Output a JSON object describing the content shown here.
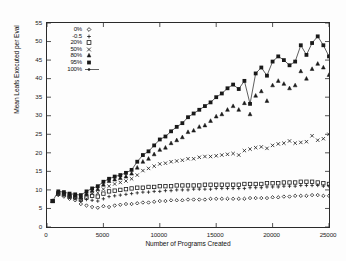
{
  "chart_data": {
    "type": "scatter",
    "title": "",
    "xlabel": "Number of Programs Created",
    "ylabel": "Mean Leafs Executed per Eval",
    "xlim": [
      0,
      25000
    ],
    "ylim": [
      0,
      55
    ],
    "xticks": [
      0,
      5000,
      10000,
      15000,
      20000,
      25000
    ],
    "yticks": [
      0,
      5,
      10,
      15,
      20,
      25,
      30,
      35,
      40,
      45,
      50,
      55
    ],
    "grid": false,
    "legend_position": "upper-left-inside",
    "x": [
      500,
      1000,
      1500,
      2000,
      2500,
      3000,
      3500,
      4000,
      4500,
      5000,
      5500,
      6000,
      6500,
      7000,
      7500,
      8000,
      8500,
      9000,
      9500,
      10000,
      10500,
      11000,
      11500,
      12000,
      12500,
      13000,
      13500,
      14000,
      14500,
      15000,
      15500,
      16000,
      16500,
      17000,
      17500,
      18000,
      18500,
      19000,
      19500,
      20000,
      20500,
      21000,
      21500,
      22000,
      22500,
      23000,
      23500,
      24000,
      24500,
      25000
    ],
    "series": [
      {
        "name": "0%",
        "label": "0%",
        "marker": "diamond",
        "line": false,
        "values": [
          7.0,
          8.6,
          8.2,
          7.6,
          7.2,
          6.2,
          5.8,
          5.4,
          5.2,
          5.6,
          5.4,
          5.8,
          6.0,
          6.2,
          6.2,
          6.4,
          6.6,
          6.6,
          6.8,
          7.0,
          7.0,
          7.2,
          7.2,
          7.2,
          7.4,
          7.4,
          7.4,
          7.4,
          7.6,
          7.6,
          7.6,
          7.6,
          7.6,
          7.6,
          7.6,
          7.8,
          7.8,
          7.8,
          7.8,
          8.0,
          8.0,
          8.2,
          8.2,
          8.4,
          8.4,
          8.4,
          8.6,
          8.6,
          8.4,
          8.4
        ]
      },
      {
        "name": "-0.5",
        "label": "-0.5",
        "marker": "plus",
        "line": false,
        "values": [
          7.0,
          8.8,
          8.6,
          8.0,
          7.6,
          7.0,
          7.4,
          7.2,
          7.0,
          7.6,
          8.2,
          8.4,
          8.6,
          8.8,
          9.0,
          9.2,
          9.4,
          9.4,
          9.6,
          9.6,
          9.8,
          9.8,
          10.0,
          10.0,
          10.0,
          10.2,
          10.2,
          10.2,
          10.2,
          10.4,
          10.4,
          10.4,
          10.4,
          10.4,
          10.4,
          10.6,
          10.6,
          10.6,
          10.8,
          10.8,
          10.8,
          11.0,
          11.0,
          11.0,
          11.2,
          11.2,
          11.2,
          11.2,
          11.0,
          11.0
        ]
      },
      {
        "name": "20%",
        "label": "20%",
        "marker": "square-open",
        "line": false,
        "values": [
          7.0,
          9.0,
          8.8,
          8.2,
          8.0,
          7.4,
          8.0,
          8.4,
          8.2,
          9.0,
          9.6,
          9.8,
          10.0,
          10.2,
          10.4,
          10.6,
          10.6,
          10.8,
          10.8,
          11.0,
          11.0,
          11.0,
          11.2,
          11.2,
          11.2,
          11.2,
          11.2,
          11.4,
          11.4,
          11.4,
          11.4,
          11.4,
          11.4,
          11.4,
          11.6,
          11.6,
          11.6,
          11.6,
          11.8,
          11.8,
          11.8,
          12.0,
          12.0,
          12.0,
          12.2,
          12.2,
          12.2,
          12.0,
          11.8,
          11.6
        ]
      },
      {
        "name": "50%",
        "label": "50%",
        "marker": "x",
        "line": false,
        "values": [
          7.0,
          9.2,
          9.0,
          8.4,
          8.2,
          7.6,
          8.4,
          9.0,
          9.2,
          10.2,
          11.0,
          11.6,
          12.0,
          12.4,
          13.0,
          14.0,
          15.2,
          15.8,
          16.4,
          17.0,
          17.2,
          17.6,
          17.8,
          18.0,
          18.4,
          18.4,
          18.8,
          19.0,
          19.0,
          19.2,
          19.4,
          19.6,
          19.8,
          19.4,
          20.6,
          21.0,
          21.4,
          21.6,
          21.2,
          22.0,
          22.4,
          22.6,
          23.2,
          22.6,
          22.8,
          23.0,
          24.6,
          23.4,
          23.8,
          25.0
        ]
      },
      {
        "name": "80%",
        "label": "80%",
        "marker": "triangle",
        "line": false,
        "values": [
          7.0,
          9.4,
          9.2,
          8.6,
          8.4,
          8.0,
          9.0,
          9.8,
          10.2,
          11.4,
          12.4,
          12.8,
          13.2,
          13.6,
          14.4,
          16.0,
          17.6,
          18.4,
          19.6,
          20.8,
          21.4,
          22.6,
          23.4,
          24.2,
          25.6,
          26.0,
          27.0,
          27.4,
          28.6,
          29.8,
          30.4,
          31.6,
          32.6,
          31.6,
          33.4,
          30.4,
          35.4,
          36.6,
          34.0,
          38.2,
          39.4,
          38.6,
          37.4,
          38.2,
          42.0,
          40.0,
          42.6,
          44.0,
          43.0,
          41.0
        ]
      },
      {
        "name": "95%",
        "label": "95%",
        "marker": "square-filled",
        "line": false,
        "values": [
          7.0,
          9.6,
          9.4,
          9.0,
          8.8,
          8.6,
          9.6,
          10.4,
          11.0,
          12.2,
          13.0,
          13.6,
          14.0,
          14.6,
          15.4,
          17.6,
          19.4,
          20.4,
          22.0,
          23.6,
          24.4,
          25.8,
          27.0,
          28.0,
          29.6,
          30.6,
          31.6,
          32.6,
          33.6,
          35.0,
          36.0,
          37.4,
          38.4,
          37.2,
          39.4,
          33.2,
          41.4,
          43.0,
          40.8,
          44.6,
          46.0,
          45.0,
          43.6,
          44.6,
          49.0,
          46.4,
          49.6,
          51.4,
          49.0,
          46.0
        ]
      },
      {
        "name": "100%",
        "label": "100%",
        "marker": "circle-filled-line",
        "line": true,
        "values": [
          7.0,
          9.6,
          9.4,
          9.0,
          8.8,
          8.6,
          9.6,
          10.4,
          11.0,
          12.2,
          13.0,
          13.6,
          14.0,
          14.6,
          15.4,
          17.6,
          19.4,
          20.4,
          22.0,
          23.6,
          24.4,
          25.8,
          27.0,
          28.0,
          29.6,
          30.6,
          31.6,
          32.6,
          33.6,
          35.0,
          36.0,
          37.4,
          38.4,
          37.2,
          39.4,
          33.2,
          41.4,
          43.0,
          40.8,
          44.6,
          46.0,
          45.0,
          43.6,
          44.6,
          49.0,
          46.4,
          49.6,
          51.4,
          49.0,
          46.0
        ]
      }
    ]
  },
  "axes": {
    "ytick_labels": [
      "0",
      "5",
      "10",
      "15",
      "20",
      "25",
      "30",
      "35",
      "40",
      "45",
      "50",
      "55"
    ],
    "xtick_labels": [
      "0",
      "5000",
      "10000",
      "15000",
      "20000",
      "25000"
    ]
  }
}
